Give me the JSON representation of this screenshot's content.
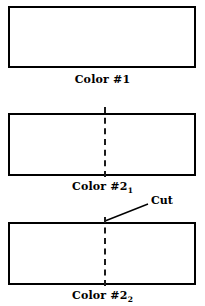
{
  "figure": {
    "background_color": "#ffffff",
    "line_color": "#000000",
    "panels": [
      {
        "id": "color-1",
        "caption_main": "Color #1",
        "caption_sub": "",
        "has_cut_line": false
      },
      {
        "id": "color-2-1",
        "caption_main": "Color #2",
        "caption_sub": "1",
        "has_cut_line": true
      },
      {
        "id": "color-2-2",
        "caption_main": "Color #2",
        "caption_sub": "2",
        "has_cut_line": true
      }
    ],
    "annotation": {
      "label": "Cut"
    }
  }
}
